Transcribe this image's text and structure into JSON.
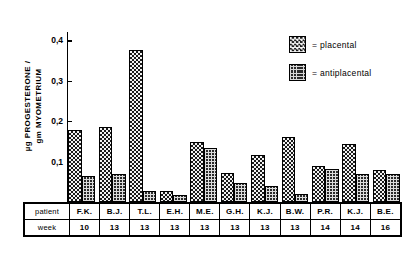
{
  "chart_data": {
    "type": "bar",
    "title": "",
    "xlabel": "",
    "ylabel": "µg PROGESTERONE / gm MYOMETRIUM",
    "ylabel_lines": [
      "µg PROGESTERONE /",
      "gm MYOMETRIUM"
    ],
    "ylim": [
      0,
      0.42
    ],
    "yticks": [
      0.1,
      0.2,
      0.3,
      0.4
    ],
    "ytick_labels": [
      "0,1",
      "0,2",
      "0,3",
      "0,4"
    ],
    "grid": false,
    "legend_position": "top-right",
    "categories": [
      "F.K.",
      "B.J.",
      "T.L.",
      "E.H.",
      "M.E.",
      "G.H.",
      "K.J.",
      "B.W.",
      "P.R.",
      "K.J.",
      "B.E."
    ],
    "series": [
      {
        "name": "placental",
        "values": [
          0.178,
          0.185,
          0.375,
          0.028,
          0.148,
          0.072,
          0.115,
          0.16,
          0.09,
          0.143,
          0.08
        ]
      },
      {
        "name": "antiplacental",
        "values": [
          0.065,
          0.068,
          0.027,
          0.018,
          0.133,
          0.048,
          0.04,
          0.02,
          0.082,
          0.068,
          0.07
        ]
      }
    ],
    "legend": [
      {
        "label": "= placental",
        "pattern": "checkerboard"
      },
      {
        "label": "= antiplacental",
        "pattern": "dense-grid"
      }
    ]
  },
  "legend": {
    "placental": "= placental",
    "antiplacental": "= antiplacental"
  },
  "table": {
    "row_labels": {
      "patient": "patient",
      "week": "week"
    },
    "patients": [
      "F.K.",
      "B.J.",
      "T.L.",
      "E.H.",
      "M.E.",
      "G.H.",
      "K.J.",
      "B.W.",
      "P.R.",
      "K.J.",
      "B.E."
    ],
    "weeks": [
      "10",
      "13",
      "13",
      "13",
      "13",
      "13",
      "13",
      "13",
      "14",
      "14",
      "16"
    ]
  }
}
